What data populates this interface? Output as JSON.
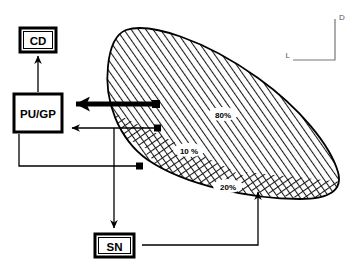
{
  "diagram": {
    "background_color": "#ffffff",
    "line_color": "#000000",
    "axis_color": "#666666"
  },
  "boxes": [
    {
      "id": "cd",
      "label": "CD",
      "x": 20,
      "y": 28,
      "width": 36,
      "height": 24
    },
    {
      "id": "pu_gp",
      "label": "PU/GP",
      "x": 14,
      "y": 94,
      "width": 48,
      "height": 38
    },
    {
      "id": "sn",
      "label": "SN",
      "x": 95,
      "y": 234,
      "width": 39,
      "height": 23
    }
  ],
  "zones": [
    {
      "id": "zone-80",
      "label": "80%",
      "x": 222,
      "y": 116
    },
    {
      "id": "zone-10",
      "label": "10 %",
      "x": 188,
      "y": 152
    },
    {
      "id": "zone-20",
      "label": "20%",
      "x": 227,
      "y": 189
    }
  ],
  "axes": {
    "vertical_label": "D",
    "horizontal_label": "L",
    "corner_x": 335,
    "corner_y": 60,
    "top_y": 18,
    "left_x": 292
  },
  "connectors": [
    {
      "id": "cd-arrow",
      "from": "pu_gp",
      "to": "cd",
      "style": "thin-up"
    },
    {
      "id": "zone80-arrow",
      "from": "zone-80",
      "to": "pu_gp",
      "style": "thick-left"
    },
    {
      "id": "zone10-arrow",
      "from": "zone-10",
      "to": "pu_gp",
      "style": "thin-left"
    },
    {
      "id": "zone20-left-arrow",
      "from": "zone-20",
      "to": "pu_gp",
      "style": "thin-elbow-left"
    },
    {
      "id": "sn-down-arrow",
      "from": "pu_gp",
      "to": "sn",
      "style": "thin-down"
    },
    {
      "id": "sn-zone20-arrow",
      "from": "sn",
      "to": "zone-20",
      "style": "thin-elbow-up"
    }
  ]
}
